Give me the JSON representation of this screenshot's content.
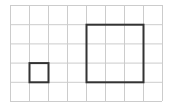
{
  "diagram": {
    "type": "grid-with-squares",
    "grid": {
      "columns": 8,
      "rows": 5,
      "origin_x": 10,
      "origin_y": 5,
      "cell_w": 19,
      "cell_h": 19.2,
      "line_color": "#cccccc"
    },
    "shapes": [
      {
        "name": "small-square",
        "col": 1,
        "row": 3,
        "w": 1,
        "h": 1,
        "stroke": "#333333"
      },
      {
        "name": "large-square",
        "col": 4,
        "row": 1,
        "w": 3,
        "h": 3,
        "stroke": "#333333"
      }
    ]
  }
}
